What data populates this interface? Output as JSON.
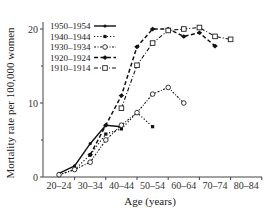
{
  "chart_data": {
    "type": "line",
    "title": "",
    "xlabel": "Age (years)",
    "ylabel": "Mortality rate per 100,000 women",
    "ylim": [
      0,
      21
    ],
    "yticks": [
      0,
      10,
      20
    ],
    "grid": false,
    "legend_position": "upper-left",
    "x": [
      "20–24",
      "25–29",
      "30–34",
      "35–39",
      "40–44",
      "45–49",
      "50–54",
      "55–59",
      "60–64",
      "65–69",
      "70–74",
      "75–79",
      "80–84"
    ],
    "x_tick_labels": [
      "20–24",
      "30–34",
      "40–44",
      "50–54",
      "60–64",
      "70–74",
      "80–84"
    ],
    "series": [
      {
        "name": "1950–1954",
        "style": "solid",
        "marker": "filled-small",
        "values": [
          0.5,
          1.5,
          4.5,
          7.0,
          6.8,
          null,
          null,
          null,
          null,
          null,
          null,
          null,
          null
        ]
      },
      {
        "name": "1940–1944",
        "style": "dotted",
        "marker": "filled-square",
        "values": [
          0.3,
          1.0,
          3.0,
          5.8,
          6.5,
          8.7,
          6.8,
          null,
          null,
          null,
          null,
          null,
          null
        ]
      },
      {
        "name": "1930–1934",
        "style": "dash-dot-fine",
        "marker": "open-circle",
        "values": [
          0.3,
          1.0,
          2.0,
          5.0,
          7.0,
          8.7,
          11.2,
          12.1,
          10.0,
          null,
          null,
          null,
          null
        ]
      },
      {
        "name": "1920–1924",
        "style": "dashed",
        "marker": "filled-diamond",
        "values": [
          null,
          null,
          3.0,
          7.0,
          11.0,
          17.6,
          20.0,
          20.0,
          19.0,
          19.5,
          17.7,
          null,
          null
        ]
      },
      {
        "name": "1910–1914",
        "style": "dash-dot",
        "marker": "open-square",
        "values": [
          null,
          null,
          null,
          null,
          9.3,
          15.1,
          18.1,
          19.8,
          20.0,
          20.2,
          19.0,
          18.6,
          null
        ]
      }
    ]
  }
}
